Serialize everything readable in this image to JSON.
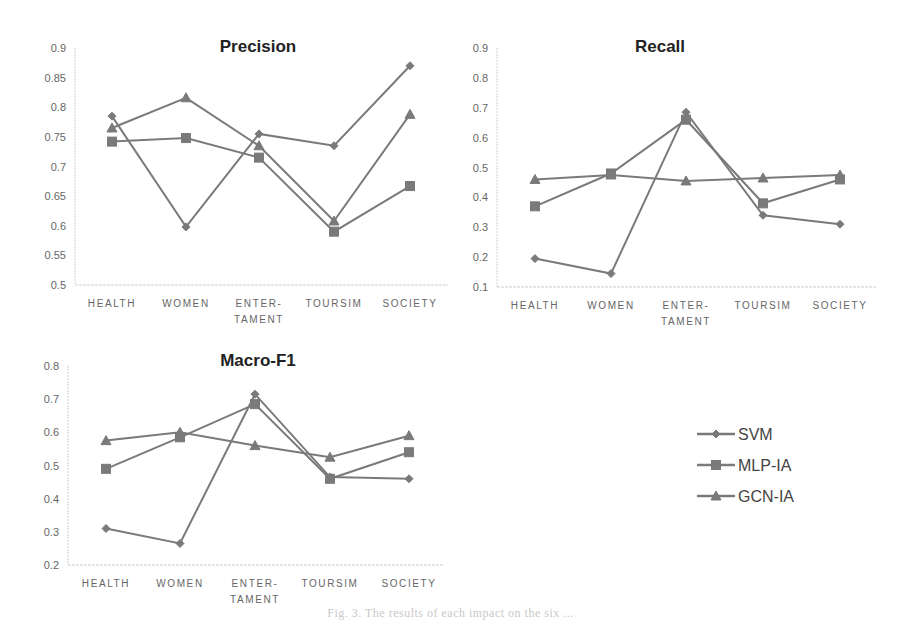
{
  "colors": {
    "series": "#7a7a7a",
    "axis": "#cfcfcf",
    "tick_text": "#666666",
    "title_text": "#222222"
  },
  "legend": {
    "items": [
      {
        "label": "SVM",
        "marker": "diamond"
      },
      {
        "label": "MLP-IA",
        "marker": "square"
      },
      {
        "label": "GCN-IA",
        "marker": "triangle"
      }
    ]
  },
  "caption": "Fig. 3.  The results of each impact on the six ...",
  "chart_data": [
    {
      "type": "line",
      "title": "Precision",
      "categories": [
        "HEALTH",
        "WOMEN",
        "ENTER-TAMENT",
        "TOURSIM",
        "SOCIETY"
      ],
      "category_lines": [
        [
          "HEALTH"
        ],
        [
          "WOMEN"
        ],
        [
          "ENTER-",
          "TAMENT"
        ],
        [
          "TOURSIM"
        ],
        [
          "SOCIETY"
        ]
      ],
      "yticks": [
        "0.5",
        "0.55",
        "0.6",
        "0.65",
        "0.7",
        "0.75",
        "0.8",
        "0.85",
        "0.9"
      ],
      "ylim": [
        0.5,
        0.9
      ],
      "xlabel": "",
      "ylabel": "",
      "grid": false,
      "series": [
        {
          "name": "SVM",
          "marker": "diamond",
          "values": [
            0.785,
            0.598,
            0.755,
            0.735,
            0.87
          ]
        },
        {
          "name": "MLP-IA",
          "marker": "square",
          "values": [
            0.742,
            0.748,
            0.715,
            0.59,
            0.667
          ]
        },
        {
          "name": "GCN-IA",
          "marker": "triangle",
          "values": [
            0.765,
            0.816,
            0.735,
            0.608,
            0.788
          ]
        }
      ],
      "frame": {
        "x0": 75,
        "x1": 448,
        "yBottom": 285,
        "yTop": 48,
        "cx": [
          112,
          186,
          259,
          334,
          410
        ],
        "titleX": 258,
        "titleY": 52
      }
    },
    {
      "type": "line",
      "title": "Recall",
      "categories": [
        "HEALTH",
        "WOMEN",
        "ENTER-TAMENT",
        "TOURSIM",
        "SOCIETY"
      ],
      "category_lines": [
        [
          "HEALTH"
        ],
        [
          "WOMEN"
        ],
        [
          "ENTER-",
          "TAMENT"
        ],
        [
          "TOURSIM"
        ],
        [
          "SOCIETY"
        ]
      ],
      "yticks": [
        "0.1",
        "0.2",
        "0.3",
        "0.4",
        "0.5",
        "0.6",
        "0.7",
        "0.8",
        "0.9"
      ],
      "ylim": [
        0.1,
        0.9
      ],
      "xlabel": "",
      "ylabel": "",
      "grid": false,
      "series": [
        {
          "name": "SVM",
          "marker": "diamond",
          "values": [
            0.195,
            0.145,
            0.685,
            0.34,
            0.31
          ]
        },
        {
          "name": "MLP-IA",
          "marker": "square",
          "values": [
            0.37,
            0.48,
            0.66,
            0.38,
            0.46
          ]
        },
        {
          "name": "GCN-IA",
          "marker": "triangle",
          "values": [
            0.46,
            0.475,
            0.455,
            0.465,
            0.475
          ]
        }
      ],
      "frame": {
        "x0": 497,
        "x1": 877,
        "yBottom": 287,
        "yTop": 48,
        "cx": [
          535,
          611,
          686,
          763,
          840
        ],
        "titleX": 660,
        "titleY": 52
      }
    },
    {
      "type": "line",
      "title": "Macro-F1",
      "categories": [
        "HEALTH",
        "WOMEN",
        "ENTER-TAMENT",
        "TOURSIM",
        "SOCIETY"
      ],
      "category_lines": [
        [
          "HEALTH"
        ],
        [
          "WOMEN"
        ],
        [
          "ENTER-",
          "TAMENT"
        ],
        [
          "TOURSIM"
        ],
        [
          "SOCIETY"
        ]
      ],
      "yticks": [
        "0.2",
        "0.3",
        "0.4",
        "0.5",
        "0.6",
        "0.7",
        "0.8"
      ],
      "ylim": [
        0.2,
        0.8
      ],
      "xlabel": "",
      "ylabel": "",
      "grid": false,
      "series": [
        {
          "name": "SVM",
          "marker": "diamond",
          "values": [
            0.31,
            0.265,
            0.715,
            0.465,
            0.46
          ]
        },
        {
          "name": "MLP-IA",
          "marker": "square",
          "values": [
            0.49,
            0.585,
            0.685,
            0.46,
            0.54
          ]
        },
        {
          "name": "GCN-IA",
          "marker": "triangle",
          "values": [
            0.575,
            0.6,
            0.56,
            0.525,
            0.59
          ]
        }
      ],
      "frame": {
        "x0": 68,
        "x1": 443,
        "yBottom": 565,
        "yTop": 366,
        "cx": [
          106,
          180,
          255,
          330,
          409
        ],
        "titleX": 258,
        "titleY": 366
      }
    }
  ]
}
